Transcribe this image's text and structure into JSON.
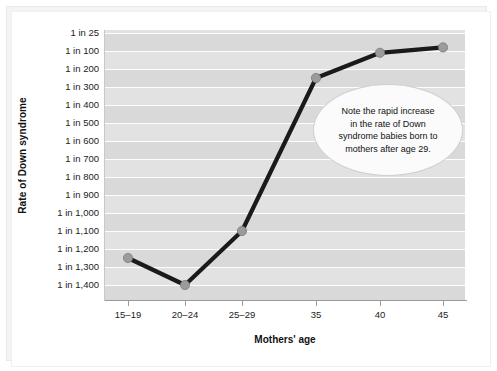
{
  "chart_data": {
    "type": "line",
    "title": "",
    "xlabel": "Mothers' age",
    "ylabel": "Rate of Down syndrome",
    "grid": true,
    "legend": "none",
    "categories": [
      "15–19",
      "20–24",
      "25–29",
      "35",
      "40",
      "45"
    ],
    "x_tick_positions_px": [
      128,
      185,
      242,
      316,
      380,
      443
    ],
    "y_tick_labels": [
      "1 in 25",
      "1 in 100",
      "1 in 200",
      "1 in 300",
      "1 in 400",
      "1 in 500",
      "1 in 600",
      "1 in 700",
      "1 in 800",
      "1 in 900",
      "1 in 1,000",
      "1 in 1,100",
      "1 in 1,200",
      "1 in 1,300",
      "1 in 1,400"
    ],
    "y_tick_denominators": [
      25,
      100,
      200,
      300,
      400,
      500,
      600,
      700,
      800,
      900,
      1000,
      1100,
      1200,
      1300,
      1400
    ],
    "values_denominator": [
      1250,
      1400,
      1100,
      250,
      110,
      85
    ],
    "values_label": [
      "1 in 1,250",
      "1 in 1,400",
      "1 in 1,100",
      "1 in 250",
      "1 in 110",
      "1 in 85"
    ],
    "series": [
      {
        "name": "Rate of Down syndrome",
        "values": [
          1250,
          1400,
          1100,
          250,
          110,
          85
        ]
      }
    ],
    "annotations": [
      {
        "text": "Note the rapid increase in the rate of Down syndrome babies born to mothers after age 29.",
        "shape": "ellipse"
      }
    ],
    "colors": {
      "line": "#1a1a1a",
      "marker": "#9b9b9b",
      "marker_edge": "#7a7a7a",
      "plot_background": "#e2e2e2",
      "band": "#d9d9d9",
      "gridline": "#fdfdfd",
      "axis": "#9a9a9a",
      "text": "#111111",
      "callout_fill": "#fbfbfb",
      "callout_border": "#cfcfcf"
    }
  },
  "callout": {
    "line1": "Note the rapid increase",
    "line2": "in the rate of Down",
    "line3": "syndrome babies born to",
    "line4": "mothers after age 29."
  }
}
